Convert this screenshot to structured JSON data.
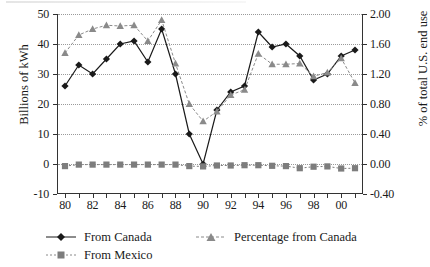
{
  "chart_data": {
    "type": "line",
    "title": "",
    "xlabel": "",
    "ylabel": "Billions of kWh",
    "y2label": "% of total U.S. end use",
    "x": [
      "80",
      "81",
      "82",
      "83",
      "84",
      "85",
      "86",
      "87",
      "88",
      "89",
      "90",
      "91",
      "92",
      "93",
      "94",
      "95",
      "96",
      "97",
      "98",
      "99",
      "00",
      "01"
    ],
    "xtick_labels": [
      "80",
      "82",
      "84",
      "86",
      "88",
      "90",
      "92",
      "94",
      "96",
      "98",
      "00"
    ],
    "ylim": [
      -10,
      50
    ],
    "yticks": [
      "50",
      "40",
      "30",
      "20",
      "10",
      "0",
      "-10"
    ],
    "y2lim": [
      -0.4,
      2.0
    ],
    "y2ticks": [
      "2.00",
      "1.60",
      "1.20",
      "0.80",
      "0.40",
      "0.00",
      "-0.40"
    ],
    "grid": true,
    "legend_position": "bottom",
    "series": [
      {
        "name": "From Canada",
        "axis": "left",
        "marker": "diamond",
        "color": "#1a1a1a",
        "linestyle": "solid",
        "values": [
          26,
          33,
          30,
          35,
          40,
          41,
          34,
          45,
          30,
          10,
          0,
          18,
          24,
          26,
          44,
          39,
          40,
          36,
          28,
          30,
          36,
          38
        ]
      },
      {
        "name": "From Mexico",
        "axis": "left",
        "marker": "square",
        "color": "#7d7d7d",
        "linestyle": "dotted",
        "values": [
          -0.7,
          -0.2,
          -0.2,
          -0.2,
          -0.2,
          -0.2,
          -0.2,
          -0.2,
          -0.2,
          -0.7,
          -0.8,
          -0.5,
          -0.5,
          -0.4,
          -0.4,
          -0.6,
          -0.7,
          -1.4,
          -0.9,
          -0.8,
          -1.5,
          -1.4
        ]
      },
      {
        "name": "Percentage from Canada",
        "axis": "right",
        "marker": "triangle",
        "color": "#8a8a8a",
        "linestyle": "dashed",
        "values": [
          1.48,
          1.72,
          1.8,
          1.85,
          1.84,
          1.85,
          1.64,
          1.92,
          1.34,
          0.8,
          0.57,
          0.7,
          0.92,
          0.99,
          1.47,
          1.33,
          1.33,
          1.34,
          1.17,
          1.22,
          1.41,
          1.08
        ]
      }
    ]
  },
  "axes": {
    "left_title": "Billions of kWh",
    "right_title": "% of total U.S. end use"
  },
  "legend": {
    "items": [
      {
        "label": "From Canada",
        "marker": "diamond-marker-icon"
      },
      {
        "label": "Percentage from Canada",
        "marker": "triangle-marker-icon"
      },
      {
        "label": "From Mexico",
        "marker": "square-marker-icon"
      }
    ]
  }
}
